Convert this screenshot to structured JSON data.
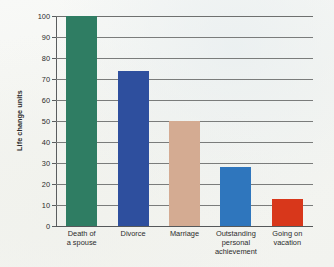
{
  "chart_data": {
    "type": "bar",
    "title": "",
    "xlabel": "",
    "ylabel": "Life change units",
    "ylim": [
      0,
      100
    ],
    "yticks": [
      0,
      10,
      20,
      30,
      40,
      50,
      60,
      70,
      80,
      90,
      100
    ],
    "ytick_labels": [
      "0",
      "10",
      "20",
      "30",
      "40",
      "50",
      "60",
      "70",
      "80",
      "90",
      "100"
    ],
    "grid": true,
    "legend": "none",
    "categories": [
      "Death of a spouse",
      "Divorce",
      "Marriage",
      "Outstanding personal achievement",
      "Going on vacation"
    ],
    "category_lines": [
      [
        "Death of",
        "a spouse"
      ],
      [
        "Divorce"
      ],
      [
        "Marriage"
      ],
      [
        "Outstanding",
        "personal",
        "achievement"
      ],
      [
        "Going on",
        "vacation"
      ]
    ],
    "values": [
      100,
      74,
      50,
      28,
      13
    ],
    "bar_colors": [
      "#2f7d63",
      "#2e4f9e",
      "#d4ab92",
      "#2f76bd",
      "#d8371b"
    ]
  },
  "colors": {
    "background": "#f6f7f4",
    "gridline": "#7a7c7b",
    "axis": "#5a5d5e",
    "text": "#2b2b2b"
  }
}
